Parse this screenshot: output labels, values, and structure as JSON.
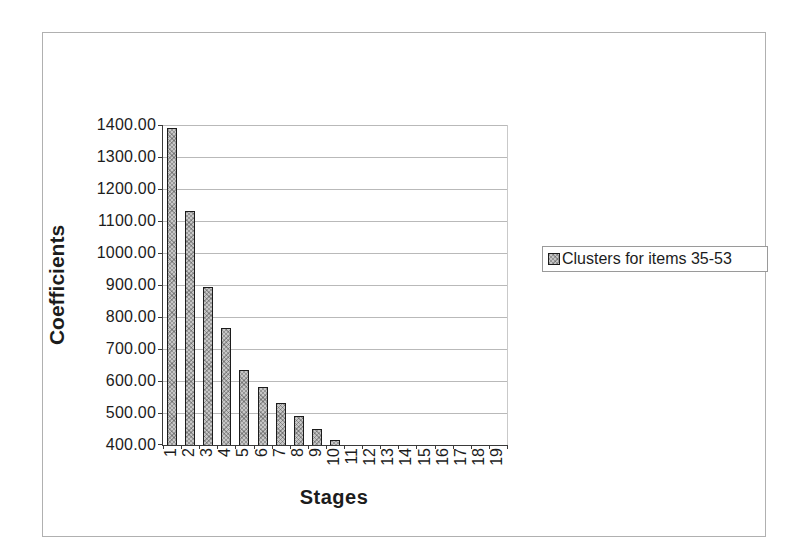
{
  "chart_data": {
    "type": "bar",
    "title": "",
    "xlabel": "Stages",
    "ylabel": "Coefficients",
    "categories": [
      "1",
      "2",
      "3",
      "4",
      "5",
      "6",
      "7",
      "8",
      "9",
      "10",
      "11",
      "12",
      "13",
      "14",
      "15",
      "16",
      "17",
      "18",
      "19"
    ],
    "series": [
      {
        "name": "Clusters for items 35-53",
        "values": [
          1390,
          1130,
          895,
          765,
          635,
          580,
          530,
          490,
          450,
          415,
          null,
          null,
          null,
          null,
          null,
          null,
          null,
          null,
          null
        ]
      }
    ],
    "ylim": [
      400,
      1400
    ],
    "ytick_step": 100,
    "ytick_labels": [
      "1400.00",
      "1300.00",
      "1200.00",
      "1100.00",
      "1000.00",
      "900.00",
      "800.00",
      "700.00",
      "600.00",
      "500.00",
      "400.00"
    ],
    "grid": true,
    "legend_position": "right",
    "colors": {
      "bar_fill": "#c6c6c6",
      "bar_border": "#1c1c1c",
      "gridline": "#b9b9b9",
      "axis": "#3a3a3a",
      "figure_border": "#b0b0b0",
      "legend_border": "#9a9a9a",
      "text": "#1c1c1c",
      "background": "#ffffff"
    }
  },
  "legend": {
    "entry_label": "Clusters for items 35-53",
    "marker_icon": "hatched-gray-square"
  }
}
